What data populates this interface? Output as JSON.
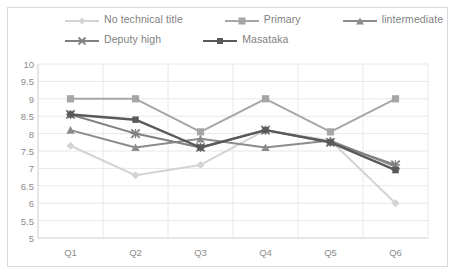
{
  "chart_data": {
    "type": "line",
    "title": "",
    "xlabel": "",
    "ylabel": "",
    "categories": [
      "Q1",
      "Q2",
      "Q3",
      "Q4",
      "Q5",
      "Q6"
    ],
    "ylim": [
      5,
      10
    ],
    "ytick_labels": [
      "10",
      "9.5",
      "9",
      "8.5",
      "8",
      "7.5",
      "7",
      "6.5",
      "6",
      "5.5",
      "5"
    ],
    "ytick_values": [
      10,
      9.5,
      9,
      8.5,
      8,
      7.5,
      7,
      6.5,
      6,
      5.5,
      5
    ],
    "grid": "vertical",
    "legend_position": "top",
    "series": [
      {
        "name": "No technical title",
        "color": "#d3d3d3",
        "marker": "diamond",
        "values": [
          7.65,
          6.8,
          7.1,
          8.1,
          7.8,
          6.0
        ]
      },
      {
        "name": "Primary",
        "color": "#a6a6a6",
        "marker": "square",
        "values": [
          9.0,
          9.0,
          8.05,
          9.0,
          8.05,
          9.0
        ]
      },
      {
        "name": "lintermediate",
        "color": "#8c8c8c",
        "marker": "triangle",
        "values": [
          8.1,
          7.6,
          7.85,
          7.6,
          7.8,
          7.05
        ]
      },
      {
        "name": "Deputy high",
        "color": "#808080",
        "marker": "x",
        "values": [
          8.55,
          8.0,
          7.6,
          8.1,
          7.75,
          7.1
        ]
      },
      {
        "name": "Masataka",
        "color": "#595959",
        "marker": "square-small",
        "values": [
          8.55,
          8.4,
          7.6,
          8.1,
          7.75,
          6.95
        ]
      }
    ]
  },
  "legend": {
    "rows": [
      [
        "No technical title",
        "Primary",
        "lintermediate"
      ],
      [
        "Deputy high",
        "Masataka"
      ]
    ]
  },
  "colors": {
    "axis": "#d9d9d9",
    "grid": "#e8e8e8",
    "tick_text": "#8c8c8c",
    "legend_text": "#7f7f7f",
    "background": "#ffffff"
  }
}
